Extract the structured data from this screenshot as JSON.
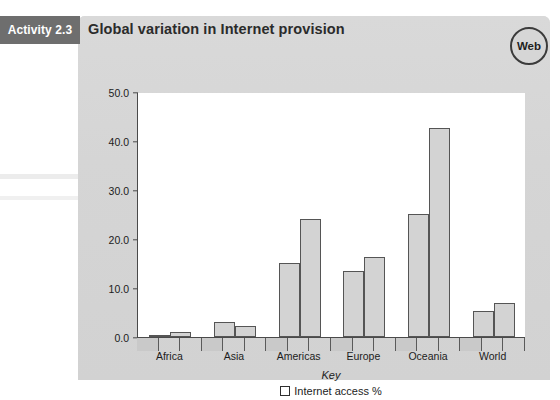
{
  "header": {
    "activity_tab": "Activity 2.3",
    "title": "Global variation in Internet provision",
    "web_badge": "Web"
  },
  "chart_data": {
    "type": "bar",
    "title": "Global variation in Internet provision",
    "xlabel": "",
    "ylabel": "",
    "ylim": [
      0,
      50
    ],
    "ytick_labels": [
      "0.0",
      "10.0",
      "20.0",
      "30.0",
      "40.0",
      "50.0"
    ],
    "ytick_values": [
      0,
      10,
      20,
      30,
      40,
      50
    ],
    "grid": false,
    "categories": [
      "Africa",
      "Asia",
      "Americas",
      "Europe",
      "Oceania",
      "World"
    ],
    "series": [
      {
        "name": "Internet access %",
        "values": [
          0.5,
          3.0,
          15.1,
          13.5,
          25.1,
          5.4
        ]
      },
      {
        "name": "Internet access %",
        "values": [
          1.1,
          2.3,
          24.0,
          16.4,
          42.7,
          6.9
        ]
      }
    ],
    "legend": {
      "position": "bottom",
      "title": "Key",
      "entries": [
        "Internet access %"
      ]
    },
    "bar_fill": "#d3d3d3",
    "bar_stroke": "#555555"
  },
  "colors": {
    "panel": "#d6d6d6",
    "tab": "#6e6e6e",
    "axis": "#4a4a4a",
    "text": "#1c1c1c"
  }
}
